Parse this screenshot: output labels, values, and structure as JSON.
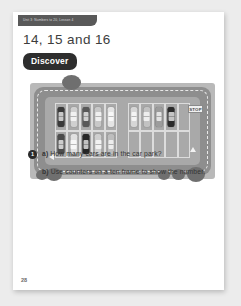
{
  "page": {
    "unit_tab_label": "Unit 3: Numbers to 20, Lesson 4",
    "lesson_title": "14, 15 and 16",
    "section_badge": "Discover",
    "page_number": "28"
  },
  "illustration": {
    "name": "car-park-scene",
    "stop_sign_label": "STOP",
    "colors": {
      "grass": "#b9b9b9",
      "road": "#8e8e8e",
      "lot": "#a9a9a9",
      "bay_line": "#dcdcdc",
      "bush": "#6f6f6f"
    },
    "blocks": [
      {
        "name": "left-parking-block",
        "rows": 2,
        "columns": 5,
        "cars": [
          {
            "bay": 1,
            "color": "#3a3a3a"
          },
          {
            "bay": 2,
            "color": "#d0d0d0"
          },
          {
            "bay": 3,
            "color": "#585858"
          },
          {
            "bay": 4,
            "color": "#c8c8c8"
          },
          {
            "bay": 5,
            "color": "#e4e4e4"
          },
          {
            "bay": 6,
            "color": "#4c4c4c"
          },
          {
            "bay": 7,
            "color": "#e0e0e0"
          },
          {
            "bay": 8,
            "color": "#262626"
          },
          {
            "bay": 9,
            "color": "#cfcfcf"
          },
          {
            "bay": 10,
            "color": "#bdbdbd"
          }
        ]
      },
      {
        "name": "right-parking-block",
        "rows": 2,
        "columns": 5,
        "cars": [
          {
            "bay": 1,
            "color": "#d6d6d6"
          },
          {
            "bay": 2,
            "color": "#c2c2c2"
          },
          {
            "bay": 3,
            "color": "#9c9c9c"
          },
          {
            "bay": 4,
            "color": "#2b2b2b"
          }
        ]
      }
    ],
    "total_cars": 14,
    "bushes": [
      {
        "x": 32,
        "y": 0,
        "w": 19,
        "h": 15
      },
      {
        "x": 6,
        "y": 95,
        "w": 12,
        "h": 10
      },
      {
        "x": 16,
        "y": 93,
        "w": 16,
        "h": 13
      },
      {
        "x": 128,
        "y": 95,
        "w": 12,
        "h": 10
      },
      {
        "x": 142,
        "y": 94,
        "w": 13,
        "h": 11
      },
      {
        "x": 157,
        "y": 92,
        "w": 18,
        "h": 15
      }
    ]
  },
  "questions": {
    "number": "1",
    "a_label": "a)",
    "a_text": "How many cars are in the car park?",
    "b_label": "b)",
    "b_text": "Use counters on a ten frame to show the number."
  }
}
